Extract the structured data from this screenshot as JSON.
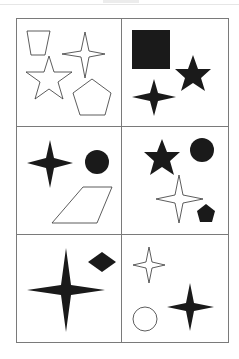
{
  "figure": {
    "type": "shape-puzzle-grid",
    "rows": 3,
    "cols": 2,
    "border_color": "#7a7a7a",
    "fill_color": "#1a1a1a",
    "cells": [
      {
        "row": 1,
        "col": 1,
        "shapes": [
          "outline trapezoid",
          "outline four-point star",
          "outline five-point star",
          "outline pentagon"
        ]
      },
      {
        "row": 1,
        "col": 2,
        "shapes": [
          "filled square",
          "filled five-point star",
          "filled four-point star"
        ]
      },
      {
        "row": 2,
        "col": 1,
        "shapes": [
          "filled four-point star",
          "filled circle",
          "outline parallelogram"
        ]
      },
      {
        "row": 2,
        "col": 2,
        "shapes": [
          "filled five-point star",
          "filled circle",
          "outline four-point star",
          "filled pentagon"
        ]
      },
      {
        "row": 3,
        "col": 1,
        "shapes": [
          "large filled four-point star",
          "filled diamond"
        ]
      },
      {
        "row": 3,
        "col": 2,
        "shapes": [
          "outline four-point star",
          "outline circle",
          "filled four-point star"
        ]
      }
    ]
  }
}
